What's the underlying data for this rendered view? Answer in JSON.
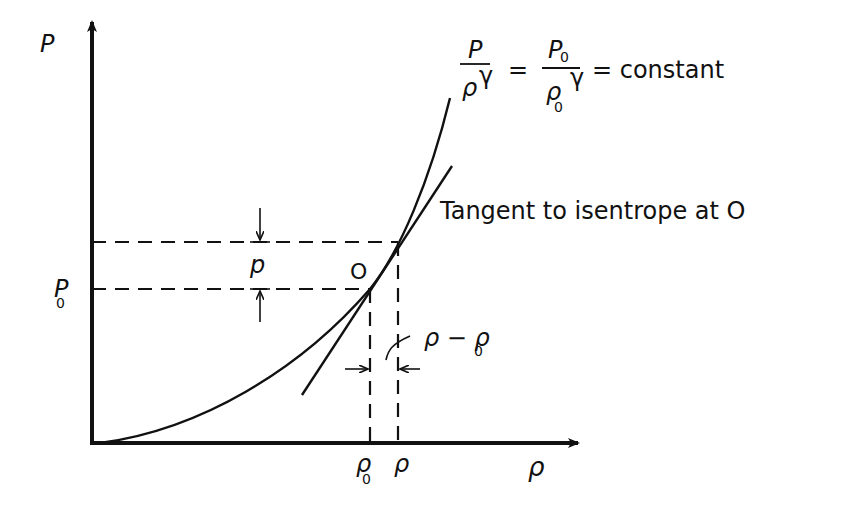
{
  "diagram": {
    "axes": {
      "y_label": "P",
      "x_label": "ρ"
    },
    "equation": {
      "lhs_num": "P",
      "lhs_den": "ρ",
      "lhs_exp": "γ",
      "eq1": "=",
      "rhs_num": "P",
      "rhs_num_sub": "0",
      "rhs_den": "ρ",
      "rhs_den_sub": "0",
      "rhs_exp": "γ",
      "eq2": "= constant"
    },
    "tangent_label": "Tangent to isentrope at O",
    "point_label": "O",
    "p0_label": "P",
    "p0_sub": "0",
    "p_label": "p",
    "rho0_label": "ρ",
    "rho0_sub": "0",
    "rho_label": "ρ",
    "delta_rho_label": "ρ − ρ",
    "delta_rho_sub": "0",
    "colors": {
      "ink": "#111111",
      "background": "#ffffff"
    }
  }
}
